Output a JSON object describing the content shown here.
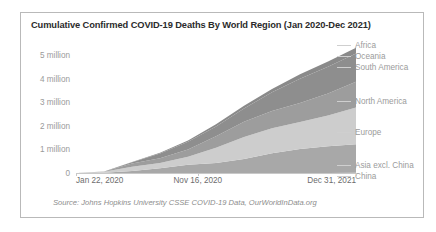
{
  "chart_data": {
    "type": "area",
    "title": "Cumulative Confirmed COVID-19 Deaths By World Region (Jan 2020-Dec 2021)",
    "xlabel": "",
    "ylabel": "",
    "stacked": true,
    "grid": false,
    "legend_position": "right",
    "source": "Source: Johns Hopkins University CSSE COVID-19 Data, OurWorldInData.org",
    "ylim": [
      0,
      5600000
    ],
    "y_ticks": [
      0,
      1000000,
      2000000,
      3000000,
      4000000,
      5000000
    ],
    "y_tick_labels": [
      "0",
      "1 million",
      "2 million",
      "3 million",
      "4 million",
      "5 million"
    ],
    "x": [
      "Jan 22, 2020",
      "Apr 01, 2020",
      "Jun 10, 2020",
      "Aug 19, 2020",
      "Nov 16, 2020",
      "Jan 25, 2021",
      "Apr 05, 2021",
      "Jun 14, 2021",
      "Aug 23, 2021",
      "Nov 01, 2021",
      "Dec 31, 2021"
    ],
    "x_ticks": [
      "Jan 22, 2020",
      "Nov 16, 2020",
      "Dec 31, 2021"
    ],
    "x_tick_positions": [
      0.0,
      0.435,
      1.0
    ],
    "series": [
      {
        "name": "China",
        "color": "#c0c0c0",
        "values": [
          0,
          3300,
          4640,
          4730,
          4750,
          4800,
          4850,
          4900,
          4950,
          5000,
          5700
        ]
      },
      {
        "name": "Asia excl. China",
        "color": "#a8a8a8",
        "values": [
          0,
          12000,
          80000,
          200000,
          340000,
          420000,
          590000,
          830000,
          1010000,
          1130000,
          1210000
        ]
      },
      {
        "name": "Europe",
        "color": "#cdcdcd",
        "values": [
          0,
          40000,
          185000,
          215000,
          340000,
          650000,
          930000,
          1060000,
          1150000,
          1300000,
          1560000
        ]
      },
      {
        "name": "North America",
        "color": "#9d9d9d",
        "values": [
          0,
          9000,
          130000,
          210000,
          310000,
          480000,
          650000,
          740000,
          810000,
          940000,
          1100000
        ]
      },
      {
        "name": "South America",
        "color": "#8e8e8e",
        "values": [
          0,
          1500,
          60000,
          200000,
          330000,
          420000,
          560000,
          790000,
          1020000,
          1130000,
          1190000
        ]
      },
      {
        "name": "Oceania",
        "color": "#bdbdbd",
        "values": [
          0,
          60,
          150,
          500,
          1000,
          1050,
          1200,
          1400,
          1700,
          3000,
          4700
        ]
      },
      {
        "name": "Africa",
        "color": "#8a8a8a",
        "values": [
          0,
          500,
          8000,
          29000,
          50000,
          90000,
          120000,
          140000,
          190000,
          220000,
          240000
        ]
      }
    ],
    "legend_entries": [
      {
        "label": "Africa",
        "y_fraction": 0.035
      },
      {
        "label": "Oceania",
        "y_fraction": 0.115
      },
      {
        "label": "South America",
        "y_fraction": 0.195
      },
      {
        "label": "North America",
        "y_fraction": 0.445
      },
      {
        "label": "Europe",
        "y_fraction": 0.665
      },
      {
        "label": "Asia excl. China",
        "y_fraction": 0.905
      },
      {
        "label": "China",
        "y_fraction": 0.985
      }
    ]
  }
}
